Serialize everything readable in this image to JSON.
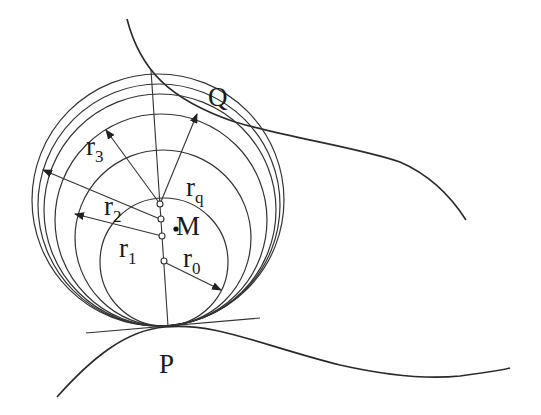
{
  "diagram": {
    "type": "geometry",
    "labels": {
      "Q": "Q",
      "P": "P",
      "M": "M",
      "r0": {
        "base": "r",
        "sub": "0"
      },
      "r1": {
        "base": "r",
        "sub": "1"
      },
      "r2": {
        "base": "r",
        "sub": "2"
      },
      "r3": {
        "base": "r",
        "sub": "3"
      },
      "rq": {
        "base": "r",
        "sub": "q"
      }
    },
    "colors": {
      "stroke": "#2a2a2a",
      "background": "#ffffff"
    }
  }
}
